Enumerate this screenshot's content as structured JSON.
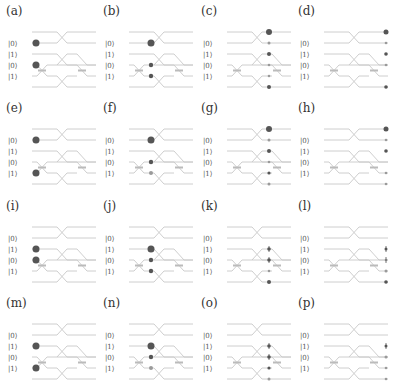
{
  "figure": {
    "colors": {
      "rail": "#c8c8c8",
      "dot_dark": "#555555",
      "dot_light": "#9a9a9a",
      "label": "#444444"
    },
    "input_labels_rows": [
      [
        "|0⟩",
        "|1⟩",
        "|0⟩",
        "|1⟩"
      ],
      [
        "|0⟩",
        "|1⟩",
        "|0⟩",
        "|1⟩"
      ],
      [
        "|0⟩",
        "|1⟩",
        "|0⟩",
        "|1⟩"
      ],
      [
        "|0⟩",
        "|1⟩",
        "|0⟩",
        "|1⟩"
      ]
    ]
  },
  "panels": [
    {
      "id": "a",
      "label": "(a)",
      "kets": [
        "|0⟩",
        "|1⟩",
        "|0⟩",
        "|1⟩"
      ],
      "dots": [
        {
          "x": 4,
          "rail": 1,
          "r": 3.5,
          "c": "dark"
        },
        {
          "x": 4,
          "rail": 3,
          "r": 3.5,
          "c": "dark"
        }
      ]
    },
    {
      "id": "b",
      "label": "(b)",
      "kets": [
        "|0⟩",
        "|1⟩",
        "|0⟩",
        "|1⟩"
      ],
      "dots": [
        {
          "x": 22,
          "rail": 1,
          "r": 3.5,
          "c": "dark"
        },
        {
          "x": 22,
          "rail": 3,
          "r": 2.2,
          "c": "dark"
        },
        {
          "x": 22,
          "rail": 4,
          "r": 2.2,
          "c": "dark"
        }
      ]
    },
    {
      "id": "c",
      "label": "(c)",
      "kets": [
        "|0⟩",
        "|1⟩",
        "|0⟩",
        "|1⟩"
      ],
      "dots": [
        {
          "x": 42,
          "rail": 0,
          "r": 3,
          "c": "dark"
        },
        {
          "x": 42,
          "rail": 1,
          "r": 1.5,
          "c": "light"
        },
        {
          "x": 42,
          "rail": 2,
          "r": 2,
          "c": "dark"
        },
        {
          "x": 42,
          "rail": 3,
          "r": 1.3,
          "c": "light"
        },
        {
          "x": 42,
          "rail": 4,
          "r": 1.3,
          "c": "light"
        },
        {
          "x": 42,
          "rail": 5,
          "r": 2,
          "c": "dark"
        }
      ]
    },
    {
      "id": "d",
      "label": "(d)",
      "kets": [
        "|0⟩",
        "|1⟩",
        "|0⟩",
        "|1⟩"
      ],
      "dots": [
        {
          "x": 62,
          "rail": 0,
          "r": 2.5,
          "c": "dark"
        },
        {
          "x": 62,
          "rail": 1,
          "r": 1.3,
          "c": "light"
        },
        {
          "x": 62,
          "rail": 2,
          "r": 1.8,
          "c": "dark"
        },
        {
          "x": 62,
          "rail": 3,
          "r": 1.3,
          "c": "light"
        },
        {
          "x": 62,
          "rail": 5,
          "r": 1.8,
          "c": "dark"
        }
      ]
    },
    {
      "id": "e",
      "label": "(e)",
      "kets": [
        "|0⟩",
        "|1⟩",
        "|0⟩",
        "|1⟩"
      ],
      "dots": [
        {
          "x": 4,
          "rail": 1,
          "r": 3.5,
          "c": "dark"
        },
        {
          "x": 4,
          "rail": 4,
          "r": 3.5,
          "c": "dark"
        }
      ]
    },
    {
      "id": "f",
      "label": "(f)",
      "kets": [
        "|0⟩",
        "|1⟩",
        "|0⟩",
        "|1⟩"
      ],
      "dots": [
        {
          "x": 22,
          "rail": 1,
          "r": 3.5,
          "c": "dark"
        },
        {
          "x": 22,
          "rail": 3,
          "r": 2.2,
          "c": "dark"
        },
        {
          "x": 22,
          "rail": 4,
          "r": 2,
          "c": "light"
        }
      ]
    },
    {
      "id": "g",
      "label": "(g)",
      "kets": [
        "|0⟩",
        "|1⟩",
        "|0⟩",
        "|1⟩"
      ],
      "dots": [
        {
          "x": 42,
          "rail": 0,
          "r": 3,
          "c": "dark"
        },
        {
          "x": 42,
          "rail": 1,
          "r": 1.5,
          "c": "light"
        },
        {
          "x": 42,
          "rail": 2,
          "r": 2,
          "c": "dark"
        },
        {
          "x": 42,
          "rail": 3,
          "r": 1.3,
          "c": "light"
        },
        {
          "x": 42,
          "rail": 4,
          "r": 1.6,
          "c": "dark"
        },
        {
          "x": 42,
          "rail": 5,
          "r": 1.5,
          "c": "light"
        }
      ]
    },
    {
      "id": "h",
      "label": "(h)",
      "kets": [
        "|0⟩",
        "|1⟩",
        "|0⟩",
        "|1⟩"
      ],
      "dots": [
        {
          "x": 62,
          "rail": 0,
          "r": 2.5,
          "c": "dark"
        },
        {
          "x": 62,
          "rail": 1,
          "r": 1.3,
          "c": "light"
        },
        {
          "x": 62,
          "rail": 2,
          "r": 1.8,
          "c": "dark"
        },
        {
          "x": 62,
          "rail": 4,
          "r": 1.3,
          "c": "light"
        },
        {
          "x": 62,
          "rail": 5,
          "r": 1.3,
          "c": "light"
        }
      ]
    },
    {
      "id": "i",
      "label": "(i)",
      "kets": [
        "|0⟩",
        "|1⟩",
        "|0⟩",
        "|1⟩"
      ],
      "dots": [
        {
          "x": 4,
          "rail": 2,
          "r": 3.5,
          "c": "dark"
        },
        {
          "x": 4,
          "rail": 3,
          "r": 3.5,
          "c": "dark"
        }
      ]
    },
    {
      "id": "j",
      "label": "(j)",
      "kets": [
        "|0⟩",
        "|1⟩",
        "|0⟩",
        "|1⟩"
      ],
      "dots": [
        {
          "x": 22,
          "rail": 2,
          "r": 3.5,
          "c": "dark"
        },
        {
          "x": 22,
          "rail": 3,
          "r": 2.2,
          "c": "dark"
        },
        {
          "x": 22,
          "rail": 4,
          "r": 2.2,
          "c": "dark"
        }
      ]
    },
    {
      "id": "k",
      "label": "(k)",
      "kets": [
        "|0⟩",
        "|1⟩",
        "|0⟩",
        "|1⟩"
      ],
      "dots": [
        {
          "x": 42,
          "rail": 2,
          "r": 1.8,
          "c": "dark",
          "bar": true
        },
        {
          "x": 42,
          "rail": 3,
          "r": 1.8,
          "c": "dark",
          "bar": true
        },
        {
          "x": 42,
          "rail": 4,
          "r": 1.3,
          "c": "light"
        },
        {
          "x": 42,
          "rail": 5,
          "r": 2,
          "c": "dark"
        }
      ]
    },
    {
      "id": "l",
      "label": "(l)",
      "kets": [
        "|0⟩",
        "|1⟩",
        "|0⟩",
        "|1⟩"
      ],
      "dots": [
        {
          "x": 62,
          "rail": 2,
          "r": 1.5,
          "c": "dark",
          "bar": true
        },
        {
          "x": 62,
          "rail": 3,
          "r": 1.3,
          "c": "light",
          "bar": true
        },
        {
          "x": 62,
          "rail": 4,
          "r": 1.5,
          "c": "light"
        },
        {
          "x": 62,
          "rail": 5,
          "r": 1.8,
          "c": "dark"
        }
      ]
    },
    {
      "id": "m",
      "label": "(m)",
      "kets": [
        "|0⟩",
        "|1⟩",
        "|0⟩",
        "|1⟩"
      ],
      "dots": [
        {
          "x": 4,
          "rail": 2,
          "r": 3.5,
          "c": "dark"
        },
        {
          "x": 4,
          "rail": 4,
          "r": 3.5,
          "c": "dark"
        }
      ]
    },
    {
      "id": "n",
      "label": "(n)",
      "kets": [
        "|0⟩",
        "|1⟩",
        "|0⟩",
        "|1⟩"
      ],
      "dots": [
        {
          "x": 22,
          "rail": 2,
          "r": 3.5,
          "c": "dark"
        },
        {
          "x": 22,
          "rail": 3,
          "r": 2.2,
          "c": "dark"
        },
        {
          "x": 22,
          "rail": 4,
          "r": 2,
          "c": "light"
        }
      ]
    },
    {
      "id": "o",
      "label": "(o)",
      "kets": [
        "|0⟩",
        "|1⟩",
        "|0⟩",
        "|1⟩"
      ],
      "dots": [
        {
          "x": 42,
          "rail": 2,
          "r": 1.8,
          "c": "dark",
          "bar": true
        },
        {
          "x": 42,
          "rail": 3,
          "r": 1.8,
          "c": "dark",
          "bar": true
        },
        {
          "x": 42,
          "rail": 4,
          "r": 1.6,
          "c": "dark"
        },
        {
          "x": 42,
          "rail": 5,
          "r": 1.5,
          "c": "light"
        }
      ]
    },
    {
      "id": "p",
      "label": "(p)",
      "kets": [
        "|0⟩",
        "|1⟩",
        "|0⟩",
        "|1⟩"
      ],
      "dots": [
        {
          "x": 62,
          "rail": 2,
          "r": 1.5,
          "c": "dark",
          "bar": true
        },
        {
          "x": 62,
          "rail": 3,
          "r": 1.5,
          "c": "light"
        },
        {
          "x": 62,
          "rail": 4,
          "r": 1.3,
          "c": "light"
        },
        {
          "x": 62,
          "rail": 5,
          "r": 1.3,
          "c": "light"
        }
      ]
    }
  ]
}
